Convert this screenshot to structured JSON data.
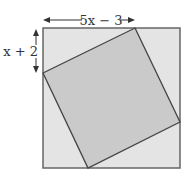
{
  "diagram": {
    "top_label": "5x − 3",
    "side_label": "x + 2",
    "colors": {
      "outer_fill": "#e4e4e4",
      "inner_fill": "#c9c9c9",
      "stroke": "#555555",
      "text": "#333333"
    }
  }
}
